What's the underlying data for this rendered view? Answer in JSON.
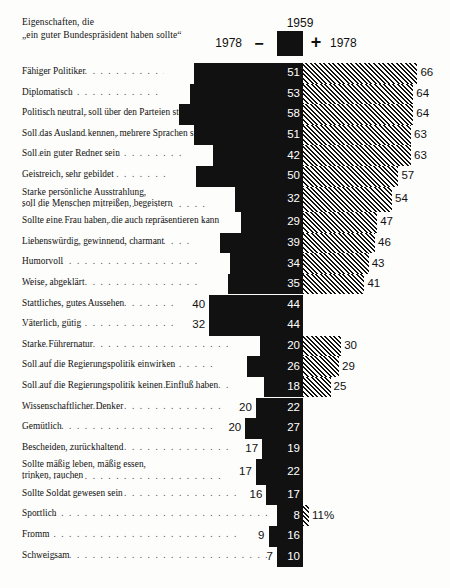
{
  "header": {
    "title": "Eigenschaften, die\n„ein guter Bundespräsident haben sollte“",
    "center_year": "1959",
    "left_year": "1978",
    "right_year": "1978",
    "minus_sign": "−",
    "plus_sign": "+"
  },
  "chart_data": {
    "type": "bar",
    "title": "Eigenschaften, die „ein guter Bundespräsident haben sollte“",
    "orientation": "horizontal-diverging",
    "xlabel": "",
    "ylabel": "",
    "grid": false,
    "legend_position": "top",
    "series": [
      {
        "name": "1959",
        "style": "solid-black",
        "side": "center"
      },
      {
        "name": "1978",
        "style": "diagonal-hatch",
        "side": "right-if-higher"
      }
    ],
    "unit": "%",
    "categories": [
      "Fähiger Politiker",
      "Diplomatisch",
      "Politisch neutral, soll über den Parteien stehen",
      "Soll das Ausland kennen, mehrere Sprachen sprechen",
      "Soll ein guter Redner sein",
      "Geistreich, sehr gebildet",
      "Starke persönliche Ausstrahlung,\nsoll die Menschen mitreißen, begeistern",
      "Sollte eine Frau haben, die auch repräsentieren kann",
      "Liebenswürdig, gewinnend, charmant",
      "Humorvoll",
      "Weise, abgeklärt",
      "Stattliches, gutes Aussehen",
      "Väterlich, gütig",
      "Starke Führernatur",
      "Soll auf die Regierungspolitik einwirken",
      "Soll auf die Regierungspolitik keinen Einfluß haben",
      "Wissenschaftlicher Denker",
      "Gemütlich",
      "Bescheiden, zurückhaltend",
      "Sollte mäßig leben, mäßig essen,\ntrinken, rauchen",
      "Sollte Soldat gewesen sein",
      "Sportlich",
      "Fromm",
      "Schweigsam"
    ],
    "values_1959": [
      51,
      53,
      58,
      51,
      42,
      50,
      32,
      29,
      39,
      34,
      35,
      44,
      44,
      20,
      26,
      18,
      22,
      27,
      19,
      22,
      17,
      8,
      16,
      10
    ],
    "values_1978": [
      66,
      64,
      64,
      63,
      63,
      57,
      54,
      47,
      46,
      43,
      41,
      40,
      32,
      30,
      29,
      25,
      20,
      20,
      17,
      17,
      16,
      11,
      9,
      7
    ]
  },
  "rows": [
    {
      "label": "Fähiger Politiker",
      "v59": "51",
      "v78": "66",
      "v78_side": "right"
    },
    {
      "label": "Diplomatisch",
      "v59": "53",
      "v78": "64",
      "v78_side": "right"
    },
    {
      "label": "Politisch neutral, soll über den Parteien stehen",
      "v59": "58",
      "v78": "64",
      "v78_side": "right"
    },
    {
      "label": "Soll das Ausland kennen, mehrere Sprachen sprechen",
      "v59": "51",
      "v78": "63",
      "v78_side": "right"
    },
    {
      "label": "Soll ein guter Redner sein",
      "v59": "42",
      "v78": "63",
      "v78_side": "right"
    },
    {
      "label": "Geistreich, sehr gebildet",
      "v59": "50",
      "v78": "57",
      "v78_side": "right"
    },
    {
      "label": "Starke persönliche Ausstrahlung,\nsoll die Menschen mitreißen, begeistern",
      "v59": "32",
      "v78": "54",
      "v78_side": "right"
    },
    {
      "label": "Sollte eine Frau haben, die auch repräsentieren kann",
      "v59": "29",
      "v78": "47",
      "v78_side": "right"
    },
    {
      "label": "Liebenswürdig, gewinnend, charmant",
      "v59": "39",
      "v78": "46",
      "v78_side": "right"
    },
    {
      "label": "Humorvoll",
      "v59": "34",
      "v78": "43",
      "v78_side": "right"
    },
    {
      "label": "Weise, abgeklärt",
      "v59": "35",
      "v78": "41",
      "v78_side": "right"
    },
    {
      "label": "Stattliches, gutes Aussehen",
      "v59": "44",
      "v78": "40",
      "v78_side": "left"
    },
    {
      "label": "Väterlich, gütig",
      "v59": "44",
      "v78": "32",
      "v78_side": "left"
    },
    {
      "label": "Starke Führernatur",
      "v59": "20",
      "v78": "30",
      "v78_side": "right"
    },
    {
      "label": "Soll auf die Regierungspolitik einwirken",
      "v59": "26",
      "v78": "29",
      "v78_side": "right"
    },
    {
      "label": "Soll auf die Regierungspolitik keinen Einfluß haben",
      "v59": "18",
      "v78": "25",
      "v78_side": "right"
    },
    {
      "label": "Wissenschaftlicher Denker",
      "v59": "22",
      "v78": "20",
      "v78_side": "left"
    },
    {
      "label": "Gemütlich",
      "v59": "27",
      "v78": "20",
      "v78_side": "left"
    },
    {
      "label": "Bescheiden, zurückhaltend",
      "v59": "19",
      "v78": "17",
      "v78_side": "left"
    },
    {
      "label": "Sollte mäßig leben, mäßig essen,\ntrinken, rauchen",
      "v59": "22",
      "v78": "17",
      "v78_side": "left"
    },
    {
      "label": "Sollte Soldat gewesen sein",
      "v59": "17",
      "v78": "16",
      "v78_side": "left"
    },
    {
      "label": "Sportlich",
      "v59": "8",
      "v78": "11%",
      "v78_side": "right"
    },
    {
      "label": "Fromm",
      "v59": "16",
      "v78": "9",
      "v78_side": "left"
    },
    {
      "label": "Schweigsam",
      "v59": "10",
      "v78": "7",
      "v78_side": "left"
    }
  ]
}
